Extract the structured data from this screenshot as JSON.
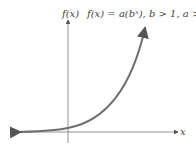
{
  "diagram": {
    "y_axis_label": "f(x)",
    "x_axis_label": "x",
    "equation": "f(x) = a(bˣ), b > 1, a > 0",
    "curve_color": "#6e6e6e",
    "axis_color": "#777777"
  }
}
